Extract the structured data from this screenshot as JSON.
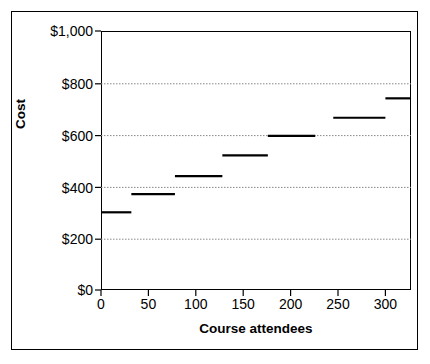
{
  "chart_data": {
    "type": "line",
    "subtype": "step",
    "title": "",
    "xlabel": "Course attendees",
    "ylabel": "Cost",
    "xlim": [
      0,
      327
    ],
    "ylim": [
      0,
      1000
    ],
    "xticks": [
      0,
      50,
      100,
      150,
      200,
      250,
      300
    ],
    "xticklabels": [
      "0",
      "50",
      "100",
      "150",
      "200",
      "250",
      "300"
    ],
    "yticks": [
      0,
      200,
      400,
      600,
      800,
      1000
    ],
    "yticklabels": [
      "$0",
      "$200",
      "$400",
      "$600",
      "$800",
      "$1,000"
    ],
    "grid": "horizontal-dotted",
    "gridlines_at": [
      200,
      400,
      600,
      800
    ],
    "legend": "none",
    "series": [
      {
        "name": "Cost",
        "color": "#000000",
        "steps": [
          {
            "x_start": 0,
            "x_end": 32,
            "y": 300
          },
          {
            "x_start": 32,
            "x_end": 78,
            "y": 370
          },
          {
            "x_start": 78,
            "x_end": 128,
            "y": 440
          },
          {
            "x_start": 128,
            "x_end": 176,
            "y": 520
          },
          {
            "x_start": 176,
            "x_end": 226,
            "y": 595
          },
          {
            "x_start": 245,
            "x_end": 300,
            "y": 665
          },
          {
            "x_start": 300,
            "x_end": 327,
            "y": 740
          }
        ]
      }
    ]
  },
  "axes": {
    "y_ticks": [
      {
        "label": "$1,000",
        "value": 1000
      },
      {
        "label": "$800",
        "value": 800
      },
      {
        "label": "$600",
        "value": 600
      },
      {
        "label": "$400",
        "value": 400
      },
      {
        "label": "$200",
        "value": 200
      },
      {
        "label": "$0",
        "value": 0
      }
    ],
    "x_ticks": [
      {
        "label": "0",
        "value": 0
      },
      {
        "label": "50",
        "value": 50
      },
      {
        "label": "100",
        "value": 100
      },
      {
        "label": "150",
        "value": 150
      },
      {
        "label": "200",
        "value": 200
      },
      {
        "label": "250",
        "value": 250
      },
      {
        "label": "300",
        "value": 300
      }
    ],
    "x_title": "Course attendees",
    "y_title": "Cost"
  },
  "style": {
    "axis_color": "#000000",
    "grid_color": "#808080",
    "series_color": "#000000",
    "background": "#ffffff"
  }
}
